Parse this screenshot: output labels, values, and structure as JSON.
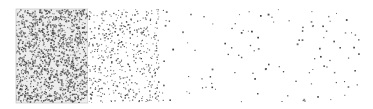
{
  "figure": {
    "background": "#ffffff",
    "dot_color": "#555555",
    "panels": [
      {
        "name": "dense",
        "x": 16,
        "y": 9,
        "w": 72,
        "h": 94,
        "dots": 1500,
        "size": 1.2,
        "bg": "#eeeeee",
        "border": true
      },
      {
        "name": "medium",
        "x": 88,
        "y": 9,
        "w": 72,
        "h": 94,
        "dots": 520,
        "size": 1.1,
        "bg": "#ffffff",
        "border": false
      },
      {
        "name": "sparse",
        "x": 160,
        "y": 9,
        "w": 200,
        "h": 94,
        "dots": 110,
        "size": 1.4,
        "bg": "#ffffff",
        "border": false
      }
    ]
  }
}
